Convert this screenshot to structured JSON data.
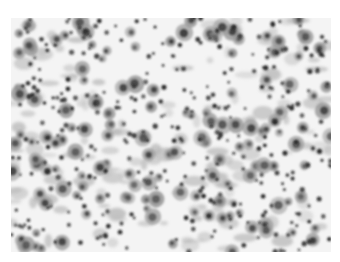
{
  "image": {
    "kind": "grayscale light micrograph",
    "subject": "cytology smear with scattered cells: large cells with dark nuclei and many small round dark cells",
    "colors": {
      "background": "#ffffff",
      "field": "#f4f4f4",
      "cytoplasm": "#9a9a9a",
      "nucleus": "#3c3c3c",
      "small_cell": "#262626",
      "debris": "#b8b8b8"
    },
    "seed": 7321,
    "counts": {
      "large_cells": 150,
      "small_cells": 320,
      "debris": 140
    }
  }
}
